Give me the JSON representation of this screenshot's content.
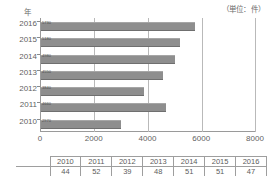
{
  "unit_label": "（単位：件）",
  "y_axis_caption": "年",
  "chart_data": {
    "type": "bar",
    "orientation": "horizontal",
    "title": "",
    "xlabel": "",
    "ylabel": "年",
    "unit": "件",
    "categories": [
      "2016",
      "2015",
      "2014",
      "2013",
      "2012",
      "2011",
      "2010"
    ],
    "values": [
      5730,
      5180,
      4980,
      4550,
      3840,
      4660,
      2970
    ],
    "xlim": [
      0,
      8000
    ],
    "xticks": [
      "0",
      "2000",
      "4000",
      "6000",
      "8000"
    ],
    "xtick_values": [
      0,
      2000,
      4000,
      6000,
      8000
    ],
    "grid": true,
    "legend": "none",
    "bar_color": "#8e8e8e"
  },
  "table": {
    "header": [
      "",
      "2010",
      "2011",
      "2012",
      "2013",
      "2014",
      "2015",
      "2016"
    ],
    "rows": [
      [
        "",
        "44",
        "52",
        "39",
        "48",
        "51",
        "51",
        "47"
      ]
    ]
  }
}
